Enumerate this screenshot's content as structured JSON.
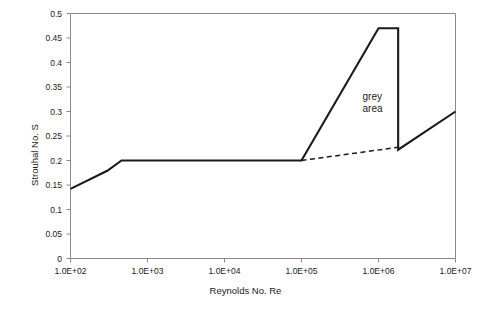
{
  "chart_data": {
    "type": "line",
    "title": "",
    "xlabel": "Reynolds No.  Re",
    "ylabel": "Strouhal No. S",
    "xscale": "log",
    "xlim": [
      100,
      10000000
    ],
    "ylim": [
      0,
      0.5
    ],
    "grid": false,
    "legend": null,
    "xticks": [
      "1.0E+02",
      "1.0E+03",
      "1.0E+04",
      "1.0E+05",
      "1.0E+06",
      "1.0E+07"
    ],
    "xtick_values": [
      100,
      1000,
      10000,
      100000,
      1000000,
      10000000
    ],
    "yticks": [
      "0",
      "0.05",
      "0.1",
      "0.15",
      "0.2",
      "0.25",
      "0.3",
      "0.35",
      "0.4",
      "0.45",
      "0.5"
    ],
    "ytick_values": [
      0,
      0.05,
      0.1,
      0.15,
      0.2,
      0.25,
      0.3,
      0.35,
      0.4,
      0.45,
      0.5
    ],
    "series": [
      {
        "name": "Strouhal number curve",
        "style": "solid",
        "color": "#1a1a1a",
        "points": [
          {
            "x": 100,
            "y": 0.142
          },
          {
            "x": 300,
            "y": 0.179
          },
          {
            "x": 460,
            "y": 0.2
          },
          {
            "x": 100000,
            "y": 0.2
          },
          {
            "x": 1000000,
            "y": 0.47
          },
          {
            "x": 1800000,
            "y": 0.47
          },
          {
            "x": 1800000,
            "y": 0.222
          },
          {
            "x": 10000000,
            "y": 0.3
          }
        ]
      },
      {
        "name": "grey area lower bound",
        "style": "dashed",
        "color": "#1a1a1a",
        "points": [
          {
            "x": 100000,
            "y": 0.2
          },
          {
            "x": 1800000,
            "y": 0.227
          }
        ]
      }
    ],
    "annotations": [
      {
        "name": "grey-area",
        "lines": [
          "grey",
          "area"
        ],
        "x": 620000,
        "y": 0.33
      }
    ]
  },
  "axes": {
    "y_title": "Strouhal No. S",
    "x_title": "Reynolds No.  Re"
  },
  "annotation": {
    "line1": "grey",
    "line2": "area"
  }
}
